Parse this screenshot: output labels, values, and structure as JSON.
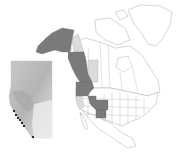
{
  "figure": {
    "type": "range map",
    "region": "North America",
    "legend": [],
    "colors": {
      "range_dark": "#7a7a7a",
      "range_light": "#dcdcdc",
      "land": "#ffffff",
      "border": "#999999",
      "inset_terrain_dark": "#a8a8a8",
      "inset_terrain_light": "#e6e6e6",
      "occurrence_point": "#000000"
    },
    "highlighted_regions_dark": [
      "Alaska",
      "British Columbia",
      "Washington",
      "Oregon",
      "Idaho",
      "Montana (west)",
      "Utah",
      "Colorado",
      "New Mexico"
    ],
    "highlighted_regions_light": [
      "Yukon",
      "Alberta",
      "California (north)"
    ],
    "inset": {
      "region": "Alberta",
      "occurrence_points": 7
    }
  }
}
